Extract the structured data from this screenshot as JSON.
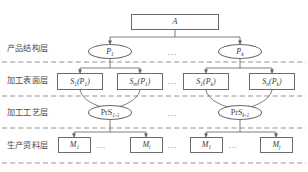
{
  "diagram": {
    "type": "hierarchy-tree",
    "background_color": "#ffffff",
    "line_color": "#6b6b6b",
    "dashed_color": "#7a7a7a",
    "text_color": "#3b3b3b",
    "ellipsis": "...",
    "layers": [
      {
        "id": "product-structure",
        "label": "产品结构层"
      },
      {
        "id": "machining-surface",
        "label": "加工表面层"
      },
      {
        "id": "machining-process",
        "label": "加工工艺层"
      },
      {
        "id": "production-resource",
        "label": "生产资料层"
      }
    ],
    "root": {
      "id": "root-a",
      "label": "A"
    },
    "product_nodes": [
      {
        "id": "p-1",
        "base": "P",
        "sub": "1"
      },
      {
        "id": "p-k",
        "base": "P",
        "sub": "k"
      }
    ],
    "surface_nodes": [
      {
        "id": "s-1-p1",
        "base": "S",
        "sub": "1",
        "arg_base": "P",
        "arg_sub": "1"
      },
      {
        "id": "s-m-p1",
        "base": "S",
        "sub": "m",
        "arg_base": "P",
        "arg_sub": "1"
      },
      {
        "id": "s-1-pk",
        "base": "S",
        "sub": "1",
        "arg_base": "P",
        "arg_sub": "k"
      },
      {
        "id": "s-n-pk",
        "base": "S",
        "sub": "n",
        "arg_base": "P",
        "arg_sub": "k"
      }
    ],
    "process_nodes": [
      {
        "id": "prs-1-1",
        "base": "PrS",
        "sub": "1-1"
      },
      {
        "id": "prs-k-1",
        "base": "PrS",
        "sub": "k-1"
      }
    ],
    "resource_nodes": [
      {
        "id": "m-1-left",
        "base": "M",
        "sub": "1"
      },
      {
        "id": "m-i-left",
        "base": "M",
        "sub": "i"
      },
      {
        "id": "m-1-right",
        "base": "M",
        "sub": "1"
      },
      {
        "id": "m-j-right",
        "base": "M",
        "sub": "j"
      }
    ]
  }
}
